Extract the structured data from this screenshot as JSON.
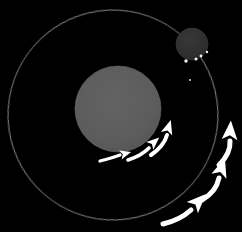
{
  "figure": {
    "title": "Barycentric orbit diagram",
    "description": "A large gray sphere and a smaller dark sphere on a shared thin elliptical orbit, with white curved motion arrows indicating direction of travel.",
    "width": 242,
    "height": 232,
    "background_color": "#000000"
  },
  "colors": {
    "background": "#000000",
    "orbit_stroke": "#b9b9b9",
    "primary_body_fill": "#5d5d5d",
    "primary_body_edge": "#6a6a6a",
    "secondary_body_fill": "#303030",
    "secondary_body_edge": "#3d3d3d",
    "arrow_white": "#ffffff",
    "speck_white": "#f2f2f2"
  },
  "orbit": {
    "name": "orbit-path",
    "center_x": 113,
    "center_y": 115,
    "radius_x": 105,
    "radius_y": 105,
    "rotation_deg": -8,
    "stroke_width": 1,
    "opacity": 0.75,
    "label": "Orbital path"
  },
  "bodies": [
    {
      "id": "primary-body",
      "label": "Primary body",
      "cx": 118,
      "cy": 109,
      "r": 43,
      "fill": "#5d5d5d",
      "role": "large-sphere"
    },
    {
      "id": "secondary-body",
      "label": "Secondary body",
      "cx": 192,
      "cy": 44,
      "r": 16,
      "fill": "#303030",
      "role": "small-sphere"
    }
  ],
  "specks": [
    {
      "cx": 186,
      "cy": 61,
      "r": 1.7,
      "label": "speck-1"
    },
    {
      "cx": 196,
      "cy": 59,
      "r": 1.5,
      "label": "speck-2"
    },
    {
      "cx": 201,
      "cy": 56,
      "r": 1.4,
      "label": "speck-3"
    },
    {
      "cx": 207,
      "cy": 52,
      "r": 1.2,
      "label": "speck-4"
    },
    {
      "cx": 190,
      "cy": 80,
      "r": 0.9,
      "label": "speck-5"
    }
  ],
  "arrows": [
    {
      "id": "arrow-inner-1",
      "label": "Inner motion arrow 1",
      "group": "inner",
      "path": "M 100 161 Q 112 158 120 155",
      "width": 3.2,
      "head_x": 124,
      "head_y": 154,
      "head_angle_deg": -16,
      "head_size": 7
    },
    {
      "id": "arrow-inner-2",
      "label": "Inner motion arrow 2",
      "group": "inner",
      "path": "M 128 160 Q 141 156 149 148",
      "width": 3.6,
      "head_x": 153,
      "head_y": 143,
      "head_angle_deg": -42,
      "head_size": 8
    },
    {
      "id": "arrow-inner-3",
      "label": "Inner motion arrow 3",
      "group": "inner",
      "path": "M 151 155 Q 164 146 167 135",
      "width": 4.0,
      "head_x": 168,
      "head_y": 129,
      "head_angle_deg": -73,
      "head_size": 9
    },
    {
      "id": "arrow-outer-1",
      "label": "Outer motion arrow 1",
      "group": "outer",
      "path": "M 163 224 Q 180 220 191 210",
      "width": 5.0,
      "head_x": 197,
      "head_y": 203,
      "head_angle_deg": -45,
      "head_size": 12
    },
    {
      "id": "arrow-outer-2",
      "label": "Outer motion arrow 2",
      "group": "outer",
      "path": "M 202 200 Q 216 192 219 178",
      "width": 5.0,
      "head_x": 221,
      "head_y": 170,
      "head_angle_deg": -72,
      "head_size": 12
    },
    {
      "id": "arrow-outer-3",
      "label": "Outer motion arrow 3",
      "group": "outer",
      "path": "M 219 165 Q 231 153 230 141",
      "width": 5.0,
      "head_x": 230,
      "head_y": 133,
      "head_angle_deg": -86,
      "head_size": 12
    }
  ]
}
